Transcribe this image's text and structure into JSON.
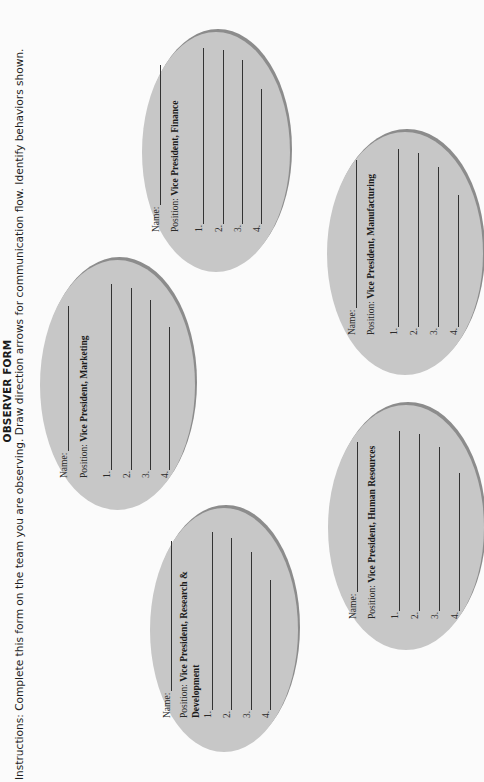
{
  "header": {
    "title": "OBSERVER FORM",
    "instructions": "Instructions: Complete this form on the team you are observing. Draw direction arrows for communication flow. Identify behaviors shown."
  },
  "form": {
    "name_label": "Name:",
    "position_label": "Position:",
    "item_numbers": [
      "1.",
      "2.",
      "3.",
      "4."
    ]
  },
  "observees": [
    {
      "id": "rd",
      "position": "Vice President, Research & Development"
    },
    {
      "id": "marketing",
      "position": "Vice President, Marketing"
    },
    {
      "id": "finance",
      "position": "Vice President, Finance"
    },
    {
      "id": "hr",
      "position": "Vice President, Human Resources"
    },
    {
      "id": "manufacturing",
      "position": "Vice President, Manufacturing"
    }
  ],
  "colors": {
    "ellipse_fill": "#c7c7c7",
    "ellipse_rim": "#8c8c8c",
    "background": "#fbfbfb",
    "text": "#1a1a1a"
  }
}
